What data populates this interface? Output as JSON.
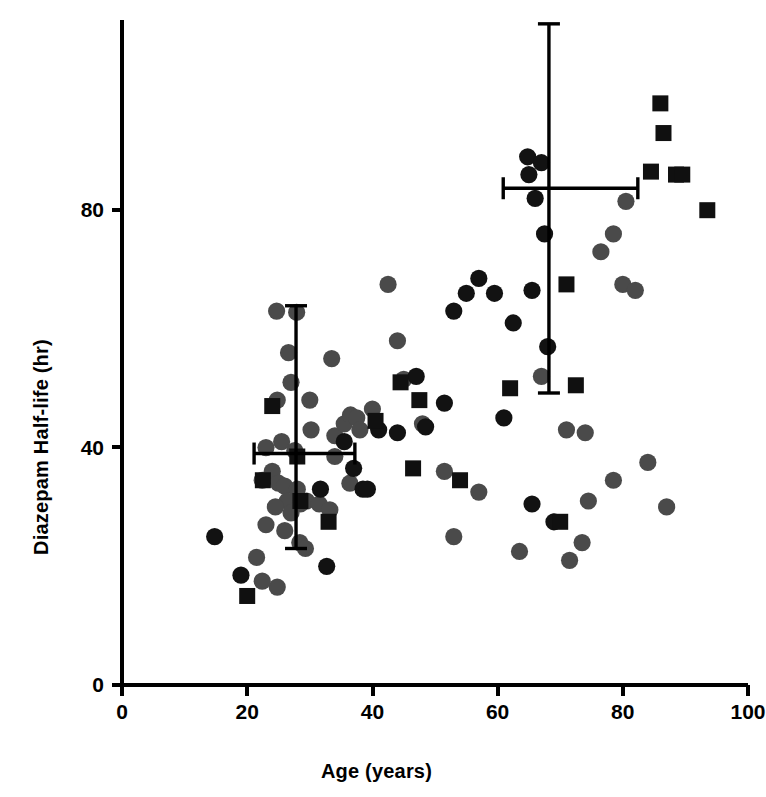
{
  "figure": {
    "title": "",
    "xlabel": "Age (years)",
    "ylabel": "Diazepam Half-life (hr)"
  },
  "axes": {
    "x_ticks": [
      "0",
      "20",
      "40",
      "60",
      "80",
      "100"
    ],
    "y_ticks": [
      "0",
      "40",
      "80"
    ]
  },
  "chart_data": {
    "type": "scatter",
    "title": "",
    "xlabel": "Age (years)",
    "ylabel": "Diazepam Half-life (hr)",
    "xlim": [
      0,
      100
    ],
    "ylim": [
      0,
      105
    ],
    "x_ticks": [
      0,
      20,
      40,
      60,
      80,
      100
    ],
    "y_ticks": [
      0,
      40,
      80
    ],
    "grid": false,
    "legend": null,
    "marker_colors": {
      "gray_circle": "#4a4a4a",
      "black_circle": "#121212",
      "black_square": "#101010"
    },
    "series": [
      {
        "name": "gray-circles",
        "marker": "circle",
        "color": "#4a4a4a",
        "points": [
          [
            24.7,
            63.0
          ],
          [
            27.9,
            62.8
          ],
          [
            26.6,
            56.0
          ],
          [
            27.0,
            51.0
          ],
          [
            24.8,
            48.0
          ],
          [
            33.5,
            55.0
          ],
          [
            30.0,
            48.0
          ],
          [
            30.2,
            43.0
          ],
          [
            23.0,
            40.0
          ],
          [
            25.5,
            41.0
          ],
          [
            27.6,
            39.5
          ],
          [
            24.0,
            36.0
          ],
          [
            22.4,
            34.5
          ],
          [
            25.0,
            34.0
          ],
          [
            26.0,
            33.5
          ],
          [
            28.0,
            33.0
          ],
          [
            26.4,
            31.0
          ],
          [
            24.5,
            30.0
          ],
          [
            27.0,
            29.0
          ],
          [
            28.5,
            30.5
          ],
          [
            29.5,
            31.0
          ],
          [
            31.5,
            30.5
          ],
          [
            23.0,
            27.0
          ],
          [
            26.0,
            26.0
          ],
          [
            28.4,
            24.0
          ],
          [
            29.3,
            23.0
          ],
          [
            21.5,
            21.5
          ],
          [
            24.8,
            16.5
          ],
          [
            22.4,
            17.5
          ],
          [
            34.0,
            38.5
          ],
          [
            34.0,
            42.0
          ],
          [
            35.5,
            44.0
          ],
          [
            36.5,
            45.5
          ],
          [
            37.5,
            45.0
          ],
          [
            38.0,
            43.0
          ],
          [
            36.4,
            34.0
          ],
          [
            33.2,
            29.5
          ],
          [
            40.0,
            46.5
          ],
          [
            42.5,
            67.5
          ],
          [
            44.0,
            58.0
          ],
          [
            45.0,
            51.5
          ],
          [
            48.0,
            44.0
          ],
          [
            51.5,
            36.0
          ],
          [
            53.0,
            25.0
          ],
          [
            67.0,
            52.0
          ],
          [
            71.0,
            43.0
          ],
          [
            74.0,
            42.5
          ],
          [
            76.5,
            73.0
          ],
          [
            80.5,
            81.5
          ],
          [
            78.5,
            76.0
          ],
          [
            80.0,
            67.5
          ],
          [
            82.0,
            66.5
          ],
          [
            71.5,
            21.0
          ],
          [
            74.5,
            31.0
          ],
          [
            78.5,
            34.5
          ],
          [
            84.0,
            37.5
          ],
          [
            73.5,
            24.0
          ],
          [
            87.0,
            30.0
          ],
          [
            63.5,
            22.5
          ],
          [
            57.0,
            32.5
          ]
        ]
      },
      {
        "name": "black-circles",
        "marker": "circle",
        "color": "#121212",
        "points": [
          [
            14.8,
            25.0
          ],
          [
            19.0,
            18.5
          ],
          [
            31.7,
            33.0
          ],
          [
            32.7,
            20.0
          ],
          [
            35.5,
            41.0
          ],
          [
            37.0,
            36.5
          ],
          [
            38.5,
            33.0
          ],
          [
            39.2,
            33.0
          ],
          [
            41.0,
            43.0
          ],
          [
            44.0,
            42.5
          ],
          [
            47.0,
            52.0
          ],
          [
            48.5,
            43.5
          ],
          [
            51.5,
            47.5
          ],
          [
            53.0,
            63.0
          ],
          [
            55.0,
            66.0
          ],
          [
            57.0,
            68.5
          ],
          [
            59.5,
            66.0
          ],
          [
            62.5,
            61.0
          ],
          [
            65.5,
            66.5
          ],
          [
            65.0,
            86.0
          ],
          [
            64.8,
            89.0
          ],
          [
            67.0,
            88.0
          ],
          [
            66.0,
            82.0
          ],
          [
            67.5,
            76.0
          ],
          [
            68.0,
            57.0
          ],
          [
            61.0,
            45.0
          ],
          [
            65.5,
            30.5
          ],
          [
            69.0,
            27.5
          ]
        ]
      },
      {
        "name": "black-squares",
        "marker": "square",
        "color": "#101010",
        "points": [
          [
            24.0,
            47.0
          ],
          [
            22.5,
            34.5
          ],
          [
            28.0,
            38.5
          ],
          [
            28.5,
            31.0
          ],
          [
            33.0,
            27.5
          ],
          [
            20.0,
            15.0
          ],
          [
            40.5,
            44.5
          ],
          [
            44.5,
            51.0
          ],
          [
            47.5,
            48.0
          ],
          [
            46.5,
            36.5
          ],
          [
            54.0,
            34.5
          ],
          [
            71.0,
            67.5
          ],
          [
            62.0,
            50.0
          ],
          [
            72.5,
            50.5
          ],
          [
            86.0,
            98.0
          ],
          [
            86.5,
            93.0
          ],
          [
            84.5,
            86.5
          ],
          [
            88.5,
            86.0
          ],
          [
            89.5,
            86.0
          ],
          [
            93.5,
            80.0
          ],
          [
            70.0,
            27.5
          ]
        ]
      }
    ],
    "error_bars": [
      {
        "name": "young-group-mean",
        "x": 27.8,
        "y": 39.0,
        "x_low": 21.1,
        "x_high": 37.2,
        "y_low": 23.0,
        "y_high": 63.9
      },
      {
        "name": "elderly-group-mean",
        "x": 68.2,
        "y": 83.7,
        "x_low": 60.9,
        "x_high": 82.4,
        "y_low": 49.2,
        "y_high": 111.4
      }
    ]
  }
}
